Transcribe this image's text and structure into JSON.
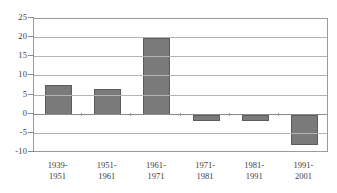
{
  "chart_data": {
    "type": "bar",
    "title": "",
    "subtitle": "",
    "xlabel": "",
    "ylabel": "",
    "categories": [
      "1939-1951",
      "1951-1961",
      "1961-1971",
      "1971-1981",
      "1981-1991",
      "1991-2001"
    ],
    "category_lines": [
      [
        "1939-",
        "1951"
      ],
      [
        "1951-",
        "1961"
      ],
      [
        "1961-",
        "1971"
      ],
      [
        "1971-",
        "1981"
      ],
      [
        "1981-",
        "1991"
      ],
      [
        "1991-",
        "2001"
      ]
    ],
    "values": [
      7.8,
      6.7,
      20.0,
      -1.6,
      -1.6,
      -7.8
    ],
    "ylim": [
      -10,
      25
    ],
    "ytick_step": 5,
    "ytick_labels": [
      "25",
      "20",
      "15",
      "10",
      "5",
      "0",
      "-5",
      "-10"
    ],
    "ytick_values": [
      25,
      20,
      15,
      10,
      5,
      0,
      -5,
      -10
    ],
    "grid": true,
    "grid_axis": "y",
    "legend": false,
    "legend_position": "none",
    "bar_color": "#7a7a7a",
    "bar_border_color": "#5c5c5c",
    "gridline_color": "#b4b4b4",
    "axis_color": "#8a8a8a",
    "background_color": "#ffffff",
    "zero_line_value": 0
  }
}
